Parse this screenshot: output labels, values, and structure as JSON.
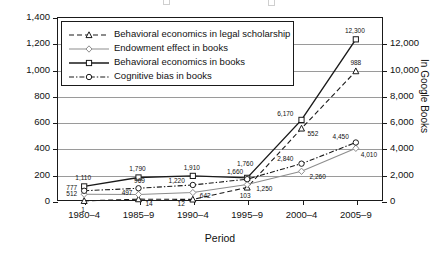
{
  "chart_data": {
    "type": "line",
    "title": "",
    "xlabel": "Period",
    "ylabel": "In legal scholarship",
    "y2label": "In Google Books",
    "categories": [
      "1980–4",
      "1985–9",
      "1990–4",
      "1995–9",
      "2000–4",
      "2005–9"
    ],
    "ylim": [
      0,
      1400
    ],
    "yticks": [
      "0",
      "200",
      "400",
      "600",
      "800",
      "1,000",
      "1,200",
      "1,400"
    ],
    "y2lim": [
      0,
      14000
    ],
    "y2ticks": [
      "0",
      "2,000",
      "4,000",
      "6,000",
      "8,000",
      "10,000",
      "12,000"
    ],
    "grid": true,
    "legend_position": "top-left",
    "series": [
      {
        "name": "Behavioral economics in legal scholarship",
        "axis": "left",
        "style": "dashed",
        "marker": "triangle",
        "values": [
          1,
          14,
          12,
          103,
          552,
          988
        ],
        "labels": [
          "1",
          "14",
          "12",
          "103",
          "552",
          "988"
        ]
      },
      {
        "name": "Endowment effect in books",
        "axis": "right",
        "style": "solid-light",
        "marker": "diamond",
        "values": [
          512,
          497,
          642,
          1250,
          2260,
          4010
        ],
        "labels": [
          "512",
          "497",
          "642",
          "1,250",
          "2,260",
          "4,010"
        ]
      },
      {
        "name": "Behavioral economics in books",
        "axis": "right",
        "style": "solid",
        "marker": "square",
        "values": [
          1110,
          1790,
          1910,
          1760,
          6170,
          12300
        ],
        "labels": [
          "1,110",
          "1,790",
          "1,910",
          "1,760",
          "6,170",
          "12,300"
        ]
      },
      {
        "name": "Cognitive bias in books",
        "axis": "right",
        "style": "dash-dot",
        "marker": "circle",
        "values": [
          777,
          969,
          1220,
          1660,
          2840,
          4450
        ],
        "labels": [
          "777",
          "969",
          "1,220",
          "1,660",
          "2,840",
          "4,450"
        ]
      }
    ]
  },
  "axes": {
    "left_title": "In legal scholarship",
    "right_title": "In Google Books",
    "x_title": "Period"
  },
  "colors": {
    "axis": "#1a1a1a",
    "grid": "#9a9a9a",
    "series_dark": "#1a1a1a",
    "series_light": "#8d8d8d"
  }
}
